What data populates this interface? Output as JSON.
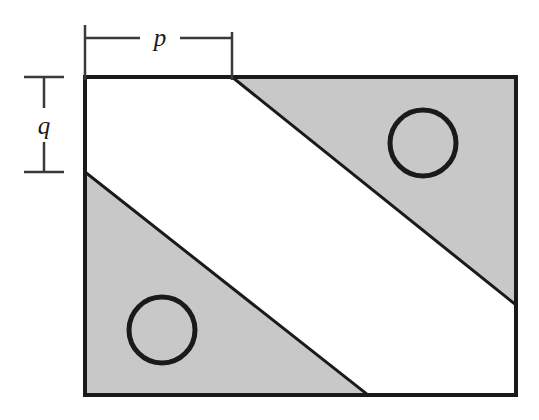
{
  "figure": {
    "canvas": {
      "width": 539,
      "height": 420,
      "background": "#ffffff"
    },
    "colors": {
      "shading_fill": "#c8c8c8",
      "unshaded_fill": "#ffffff",
      "outline_stroke": "#1a1a1a",
      "circle_stroke": "#1a1a1a",
      "dimension_stroke": "#3a3a3a",
      "label_color": "#1a1a1a"
    },
    "rectangle": {
      "name": "main-rectangle",
      "left": 85,
      "top": 77,
      "right": 516,
      "bottom": 395,
      "width": 431,
      "height": 318,
      "stroke_width": 4
    },
    "diagonals": [
      {
        "name": "upper-diagonal",
        "from_x": 232,
        "from_y": 77,
        "to_x": 516,
        "to_y": 305,
        "stroke_width": 3
      },
      {
        "name": "lower-diagonal",
        "from_x": 85,
        "from_y": 172,
        "to_x": 368,
        "to_y": 395,
        "stroke_width": 3
      }
    ],
    "shaded_regions": [
      {
        "name": "upper-right-shaded-triangle",
        "points": "232,77 516,77 516,305",
        "fill": "#c8c8c8"
      },
      {
        "name": "lower-left-shaded-triangle",
        "points": "85,172 368,395 85,395",
        "fill": "#c8c8c8"
      }
    ],
    "circles": [
      {
        "name": "upper-right-circle",
        "cx": 423,
        "cy": 143,
        "r": 33,
        "stroke_width": 5,
        "fill": "none"
      },
      {
        "name": "lower-left-circle",
        "cx": 162,
        "cy": 330,
        "r": 33,
        "stroke_width": 5,
        "fill": "none"
      }
    ],
    "dimensions": [
      {
        "name": "p-dimension",
        "label": "p",
        "orientation": "horizontal",
        "line_y": 38,
        "start_x": 85,
        "end_x": 232,
        "label_x": 160,
        "label_y": 46,
        "gap_left_x": 140,
        "gap_right_x": 180,
        "tick_left_x": 85,
        "tick_left_y1": 25,
        "tick_left_y2": 80,
        "tick_right_x": 232,
        "tick_right_y1": 32,
        "tick_right_y2": 80,
        "stroke_width": 2.5
      },
      {
        "name": "q-dimension",
        "label": "q",
        "orientation": "vertical",
        "line_x": 44,
        "start_y": 77,
        "end_y": 172,
        "label_x": 44,
        "label_y": 134,
        "gap_top_y": 108,
        "gap_bottom_y": 142,
        "tick_top_y": 77,
        "tick_top_x1": 24,
        "tick_top_x2": 64,
        "tick_bottom_y": 172,
        "tick_bottom_x1": 24,
        "tick_bottom_x2": 64,
        "stroke_width": 2.5
      }
    ]
  }
}
